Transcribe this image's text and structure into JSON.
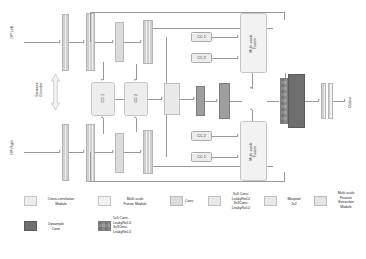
{
  "figure": {
    "type": "architecture-diagram"
  },
  "inputs": {
    "left": "DP Left",
    "right": "DP Right"
  },
  "output": {
    "label": "Output"
  },
  "encoder": {
    "label": "Siamese\nEncoder"
  },
  "cross_correlation": {
    "top_module": "CC 1",
    "bottom_module": "CC 2",
    "top_branch": [
      "CC 1",
      "CC 2"
    ],
    "bottom_branch": [
      "CC 2",
      "CC 1"
    ]
  },
  "fusion": {
    "top": "Multi-scale\nFusion",
    "bottom": "Multi-scale\nFusion"
  },
  "legend": {
    "row1": [
      {
        "name": "cross-correlation-module",
        "label": "Cross-correlation\nModule",
        "color": "#ededed"
      },
      {
        "name": "multi-scale-fusion-module",
        "label": "Multi-scale\nFusion Module",
        "color": "#f2f2f2"
      },
      {
        "name": "conv",
        "label": "Conv",
        "color": "#dcdcdc"
      },
      {
        "name": "conv-leakyrelu-stack",
        "label": "3x3 Conv-\nLeakyReLU\n3x3Conv-\nLeakyReLU",
        "color": "#e9e9e9"
      },
      {
        "name": "maxpool",
        "label": "Maxpool\n2x2",
        "color": "#e9e9e9"
      },
      {
        "name": "multi-scale-feature-extraction-module",
        "label": "Multi-scale\nFeature\nExtraction\nModule",
        "color": "#e4e4e4"
      }
    ],
    "row2": [
      {
        "name": "upsample-conv",
        "label": "Upsample\nConv",
        "color": "#6e6e6e"
      },
      {
        "name": "conv5-leakyrelu-stack",
        "label": "5x5 Conv-\nLeakyReLU\n3x3Conv-\nLeakyReLU",
        "color": "#9d9d9d"
      }
    ]
  }
}
